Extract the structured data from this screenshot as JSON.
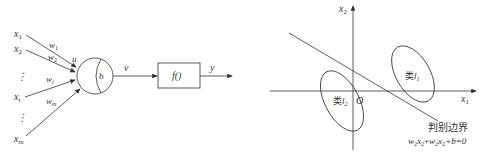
{
  "neuron_diagram": {
    "inputs": [
      {
        "label": "x",
        "sub": "1",
        "weight": "w",
        "wsub": "1"
      },
      {
        "label": "x",
        "sub": "2",
        "weight": "w",
        "wsub": "2"
      },
      {
        "label": "x",
        "sub": "i",
        "weight": "w",
        "wsub": "i"
      },
      {
        "label": "x",
        "sub": "m",
        "weight": "w",
        "wsub": "m"
      }
    ],
    "ellipsis": "⋮",
    "sum_label": "u",
    "bias_label": "b",
    "net_label": "v",
    "activation_label": "f()",
    "output_label": "y"
  },
  "decision_diagram": {
    "x_axis_label": "x",
    "x_axis_sub": "1",
    "y_axis_label": "x",
    "y_axis_sub": "2",
    "origin_label": "O",
    "class1_label": "类",
    "class1_sym": "l",
    "class1_sub": "1",
    "class2_label": "类",
    "class2_sym": "l",
    "class2_sub": "2",
    "boundary_title": "判别边界",
    "boundary_eq": {
      "w_a": "w",
      "w_a_sub": "2",
      "x_a": "x",
      "x_a_sub": "2",
      "w_b": "w",
      "w_b_sub": "2",
      "x_b": "x",
      "x_b_sub": "2",
      "rest": "+b=0"
    }
  }
}
